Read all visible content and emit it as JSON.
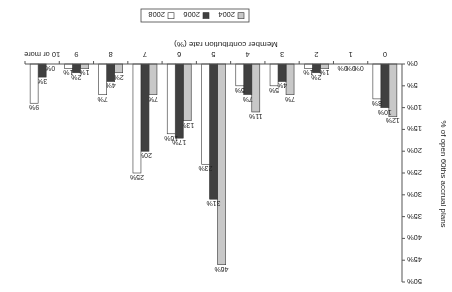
{
  "chart_data": {
    "type": "bar",
    "orientation": "rendered rotated 180 degrees",
    "title": "",
    "xlabel": "Member contribution rate (%)",
    "ylabel": "% of open 60ths accrual plans",
    "categories": [
      "0",
      "1",
      "2",
      "3",
      "4",
      "5",
      "6",
      "7",
      "8",
      "9",
      "10 or more"
    ],
    "series": [
      {
        "name": "2004",
        "color": "#c8c8c8",
        "values": [
          12,
          0,
          1,
          7,
          11,
          46,
          13,
          7,
          2,
          1,
          0
        ]
      },
      {
        "name": "2006",
        "color": "#404040",
        "values": [
          10,
          0,
          2,
          4,
          7,
          31,
          17,
          20,
          4,
          2,
          3
        ]
      },
      {
        "name": "2008",
        "color": "#ffffff",
        "values": [
          8,
          0,
          1,
          5,
          5,
          23,
          16,
          25,
          7,
          1,
          9
        ]
      }
    ],
    "ylim": [
      0,
      50
    ],
    "yticks": [
      "0%",
      "5%",
      "10%",
      "15%",
      "20%",
      "25%",
      "30%",
      "35%",
      "40%",
      "45%",
      "50%"
    ],
    "grid": false,
    "legend_position": "bottom",
    "value_label_suffix": "%"
  }
}
